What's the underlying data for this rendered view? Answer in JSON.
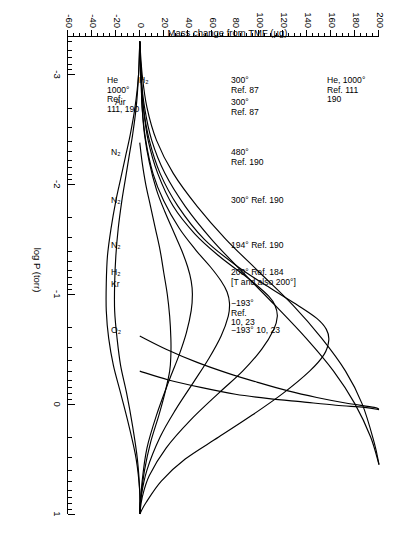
{
  "chart_data": {
    "type": "line",
    "title": "",
    "xlabel": "log P (torr)",
    "ylabel": "Mass change from TMF (µg)",
    "xlim": [
      -3.35,
      1.0
    ],
    "ylim": [
      -60,
      200
    ],
    "grid": false,
    "legend": "inline-annotations",
    "x_ticks": [
      "-3",
      "-2",
      "-1",
      "0",
      "1"
    ],
    "x_tick_values": [
      -3,
      -2,
      -1,
      0,
      1
    ],
    "x_minor_note": "logarithmic decade subdivisions between each major tick",
    "y_ticks": [
      "200",
      "180",
      "160",
      "140",
      "120",
      "100",
      "80",
      "60",
      "40",
      "20",
      "0",
      "-20",
      "-40",
      "-60"
    ],
    "y_tick_values": [
      200,
      180,
      160,
      140,
      120,
      100,
      80,
      60,
      40,
      20,
      0,
      -20,
      -40,
      -60
    ],
    "series": [
      {
        "name": "He, 1000° Ref. 111, 190 (upper)",
        "gas": "He",
        "temperature": "1000°",
        "reference": "111, 190",
        "points": [
          [
            -3.3,
            0
          ],
          [
            -3.0,
            2
          ],
          [
            -2.7,
            6
          ],
          [
            -2.4,
            14
          ],
          [
            -2.1,
            28
          ],
          [
            -1.8,
            48
          ],
          [
            -1.5,
            72
          ],
          [
            -1.2,
            100
          ],
          [
            -0.9,
            128
          ],
          [
            -0.6,
            152
          ],
          [
            -0.3,
            172
          ],
          [
            0.0,
            186
          ],
          [
            0.35,
            196
          ],
          [
            0.55,
            200
          ]
        ]
      },
      {
        "name": "H2 300° Ref. 87",
        "gas": "H2",
        "temperature": "300°",
        "reference": "87",
        "points": [
          [
            -3.3,
            0
          ],
          [
            -3.0,
            1
          ],
          [
            -2.7,
            4
          ],
          [
            -2.4,
            10
          ],
          [
            -2.1,
            21
          ],
          [
            -1.8,
            38
          ],
          [
            -1.5,
            60
          ],
          [
            -1.2,
            86
          ],
          [
            -0.9,
            113
          ],
          [
            -0.6,
            139
          ],
          [
            -0.3,
            162
          ],
          [
            0.0,
            180
          ],
          [
            0.3,
            193
          ],
          [
            0.55,
            200
          ]
        ]
      },
      {
        "name": "Air 300° Ref. 87",
        "gas": "Air",
        "temperature": "300°",
        "reference": "87",
        "points": [
          [
            -3.3,
            0
          ],
          [
            -3.0,
            1
          ],
          [
            -2.7,
            3
          ],
          [
            -2.4,
            8
          ],
          [
            -2.1,
            17
          ],
          [
            -1.8,
            32
          ],
          [
            -1.5,
            54
          ],
          [
            -1.25,
            82
          ],
          [
            -1.05,
            110
          ],
          [
            -0.9,
            132
          ],
          [
            -0.78,
            148
          ],
          [
            -0.68,
            156
          ],
          [
            -0.58,
            158
          ],
          [
            -0.45,
            154
          ],
          [
            -0.3,
            142
          ],
          [
            -0.1,
            120
          ],
          [
            0.1,
            94
          ],
          [
            0.3,
            66
          ],
          [
            0.5,
            38
          ],
          [
            0.7,
            18
          ],
          [
            0.9,
            5
          ],
          [
            1.0,
            0
          ]
        ]
      },
      {
        "name": "N2 480° Ref. 190",
        "gas": "N2",
        "temperature": "480°",
        "reference": "190",
        "points": [
          [
            -3.3,
            0
          ],
          [
            -3.0,
            1
          ],
          [
            -2.7,
            3
          ],
          [
            -2.4,
            7
          ],
          [
            -2.1,
            15
          ],
          [
            -1.8,
            28
          ],
          [
            -1.55,
            46
          ],
          [
            -1.35,
            66
          ],
          [
            -1.2,
            84
          ],
          [
            -1.08,
            98
          ],
          [
            -0.98,
            108
          ],
          [
            -0.9,
            113
          ],
          [
            -0.8,
            115
          ],
          [
            -0.68,
            112
          ],
          [
            -0.5,
            102
          ],
          [
            -0.3,
            86
          ],
          [
            -0.1,
            66
          ],
          [
            0.15,
            42
          ],
          [
            0.4,
            22
          ],
          [
            0.65,
            8
          ],
          [
            0.85,
            2
          ],
          [
            1.0,
            0
          ]
        ]
      },
      {
        "name": "N2 300° Ref. 190",
        "gas": "N2",
        "temperature": "300°",
        "reference": "190",
        "points": [
          [
            -3.3,
            0
          ],
          [
            -3.0,
            1
          ],
          [
            -2.7,
            2
          ],
          [
            -2.4,
            5
          ],
          [
            -2.1,
            11
          ],
          [
            -1.85,
            20
          ],
          [
            -1.6,
            33
          ],
          [
            -1.4,
            47
          ],
          [
            -1.25,
            59
          ],
          [
            -1.12,
            68
          ],
          [
            -1.02,
            73
          ],
          [
            -0.92,
            75
          ],
          [
            -0.8,
            74
          ],
          [
            -0.62,
            68
          ],
          [
            -0.42,
            58
          ],
          [
            -0.2,
            45
          ],
          [
            0.05,
            30
          ],
          [
            0.3,
            17
          ],
          [
            0.6,
            6
          ],
          [
            0.85,
            1
          ],
          [
            1.0,
            0
          ]
        ]
      },
      {
        "name": "N2 194° Ref. 190",
        "gas": "N2",
        "temperature": "194°",
        "reference": "190",
        "points": [
          [
            -3.3,
            0
          ],
          [
            -3.0,
            1
          ],
          [
            -2.7,
            2
          ],
          [
            -2.45,
            4
          ],
          [
            -2.2,
            8
          ],
          [
            -1.95,
            14
          ],
          [
            -1.75,
            21
          ],
          [
            -1.55,
            29
          ],
          [
            -1.4,
            35
          ],
          [
            -1.25,
            40
          ],
          [
            -1.12,
            43
          ],
          [
            -1.0,
            44
          ],
          [
            -0.85,
            43
          ],
          [
            -0.65,
            39
          ],
          [
            -0.45,
            33
          ],
          [
            -0.2,
            24
          ],
          [
            0.1,
            14
          ],
          [
            0.4,
            6
          ],
          [
            0.7,
            2
          ],
          [
            1.0,
            0
          ]
        ]
      },
      {
        "name": "H2 200° Ref. 184 [T and also 200°]",
        "gas": "H2",
        "temperature": "200°",
        "reference": "184",
        "note": "[T and also 200°]",
        "points": [
          [
            -2.38,
            0
          ],
          [
            -2.2,
            2
          ],
          [
            -2.0,
            5
          ],
          [
            -1.8,
            9
          ],
          [
            -1.6,
            13
          ],
          [
            -1.4,
            17
          ],
          [
            -1.2,
            20
          ],
          [
            -1.0,
            23
          ],
          [
            -0.8,
            25
          ],
          [
            -0.6,
            26
          ],
          [
            -0.45,
            26
          ],
          [
            -0.3,
            25
          ],
          [
            -0.1,
            21
          ],
          [
            0.1,
            16
          ],
          [
            0.35,
            9
          ],
          [
            0.6,
            4
          ],
          [
            0.85,
            1
          ],
          [
            1.0,
            0
          ]
        ]
      },
      {
        "name": "Kr -193° Ref. 10, 23",
        "gas": "Kr",
        "temperature": "-193°",
        "reference": "10, 23",
        "points": [
          [
            -3.3,
            0
          ],
          [
            -3.0,
            -1
          ],
          [
            -2.7,
            -3
          ],
          [
            -2.45,
            -6
          ],
          [
            -2.25,
            -9
          ],
          [
            -2.05,
            -12
          ],
          [
            -1.85,
            -15
          ],
          [
            -1.6,
            -18
          ],
          [
            -1.35,
            -20
          ],
          [
            -1.1,
            -21
          ],
          [
            -0.85,
            -21
          ],
          [
            -0.6,
            -19
          ],
          [
            -0.35,
            -16
          ],
          [
            -0.1,
            -11
          ],
          [
            0.2,
            -6
          ],
          [
            0.5,
            -2
          ],
          [
            0.8,
            0
          ],
          [
            1.0,
            0
          ]
        ]
      },
      {
        "name": "O2 -193° Ref. 10, 23",
        "gas": "O2",
        "temperature": "-193°",
        "reference": "10, 23",
        "points": [
          [
            -3.3,
            0
          ],
          [
            -3.0,
            -1
          ],
          [
            -2.7,
            -4
          ],
          [
            -2.45,
            -8
          ],
          [
            -2.25,
            -12
          ],
          [
            -2.05,
            -16
          ],
          [
            -1.85,
            -20
          ],
          [
            -1.6,
            -24
          ],
          [
            -1.35,
            -27
          ],
          [
            -1.1,
            -28
          ],
          [
            -0.85,
            -28
          ],
          [
            -0.6,
            -26
          ],
          [
            -0.35,
            -22
          ],
          [
            -0.1,
            -16
          ],
          [
            0.2,
            -9
          ],
          [
            0.5,
            -3
          ],
          [
            0.8,
            0
          ],
          [
            1.0,
            0
          ]
        ]
      },
      {
        "name": "He, 1000° Ref. 111 190 (top, steep)",
        "gas": "He",
        "temperature": "1000°",
        "reference": "111, 190",
        "points": [
          [
            -0.62,
            0
          ],
          [
            -0.5,
            22
          ],
          [
            -0.38,
            48
          ],
          [
            -0.28,
            74
          ],
          [
            -0.2,
            98
          ],
          [
            -0.12,
            124
          ],
          [
            -0.06,
            148
          ],
          [
            -0.01,
            172
          ],
          [
            0.03,
            196
          ],
          [
            0.05,
            200
          ]
        ]
      },
      {
        "name": "H2 unlabeled steep (Ref. 87)",
        "gas": "H2",
        "temperature": "300°",
        "reference": "87",
        "points": [
          [
            -0.3,
            0
          ],
          [
            -0.22,
            24
          ],
          [
            -0.15,
            52
          ],
          [
            -0.09,
            80
          ],
          [
            -0.05,
            108
          ],
          [
            -0.02,
            136
          ],
          [
            0.01,
            164
          ],
          [
            0.03,
            188
          ],
          [
            0.05,
            200
          ]
        ]
      }
    ],
    "annotations": [
      {
        "id": "ann-he-top",
        "lines": [
          "He, 1000°",
          "Ref. 111",
          "190"
        ]
      },
      {
        "id": "ann-h2-ref87-upper",
        "lines": [
          "300°",
          "Ref. 87"
        ]
      },
      {
        "id": "ann-air-ref87",
        "lines": [
          "300°",
          "Ref. 87"
        ]
      },
      {
        "id": "ann-n2-480",
        "lines": [
          "480°",
          "Ref. 190"
        ]
      },
      {
        "id": "ann-n2-300",
        "lines": [
          "300° Ref. 190"
        ]
      },
      {
        "id": "ann-n2-194",
        "lines": [
          "194° Ref. 190"
        ]
      },
      {
        "id": "ann-h2-200",
        "lines": [
          "200° Ref. 184",
          "[T and also 200°]"
        ]
      },
      {
        "id": "ann-kr",
        "lines": [
          "−193°",
          "Ref.",
          "10, 23"
        ]
      },
      {
        "id": "ann-o2",
        "lines": [
          "−193°   10, 23"
        ]
      },
      {
        "id": "ann-he-lower",
        "lines": [
          "He",
          "1000°",
          "Ref.",
          "111, 190"
        ]
      },
      {
        "id": "ann-h2-left",
        "lines": [
          "H₂"
        ]
      },
      {
        "id": "ann-air-left",
        "lines": [
          "Air"
        ]
      },
      {
        "id": "ann-n2-a",
        "lines": [
          "N₂"
        ]
      },
      {
        "id": "ann-n2-b",
        "lines": [
          "N₂"
        ]
      },
      {
        "id": "ann-n2-c",
        "lines": [
          "N₂"
        ]
      },
      {
        "id": "ann-h2-b",
        "lines": [
          "H₂"
        ]
      },
      {
        "id": "ann-kr-b",
        "lines": [
          "Kr"
        ]
      },
      {
        "id": "ann-o2-b",
        "lines": [
          "O₂"
        ]
      }
    ]
  },
  "labels": {
    "x_title": "log P (torr)",
    "y_title": "Mass change from TMF (µg)",
    "x": [
      "-3",
      "-2",
      "-1",
      "0",
      "1"
    ],
    "y": [
      "200",
      "180",
      "160",
      "140",
      "120",
      "100",
      "80",
      "60",
      "40",
      "20",
      "0",
      "-20",
      "-40",
      "-60"
    ]
  },
  "ann_text": {
    "he_top_l1": "He, 1000°",
    "he_top_l2": "Ref. 111",
    "he_top_l3": "190",
    "h2_87_l1": "300°",
    "h2_87_l2": "Ref. 87",
    "air_87_l1": "300°",
    "air_87_l2": "Ref. 87",
    "n2_480_l1": "480°",
    "n2_480_l2": "Ref. 190",
    "n2_300": "300° Ref. 190",
    "n2_194": "194° Ref. 190",
    "h2_200_l1": "200° Ref. 184",
    "h2_200_l2": "[T and also 200°]",
    "kr_l1": "−193°",
    "kr_l2": "Ref.",
    "kr_l3": "10, 23",
    "o2_l1": "−193°   10, 23",
    "he_low_l1": "He",
    "he_low_l2": "1000°",
    "he_low_l3": "Ref.",
    "he_low_l4": "111, 190",
    "h2_sym": "H₂",
    "air_sym": "Air",
    "n2_sym_a": "N₂",
    "n2_sym_b": "N₂",
    "n2_sym_c": "N₂",
    "h2_sym_b": "H₂",
    "kr_sym": "Kr",
    "o2_sym": "O₂"
  },
  "colors": {
    "curve": "#000000",
    "axis": "#000000",
    "background": "#ffffff"
  }
}
